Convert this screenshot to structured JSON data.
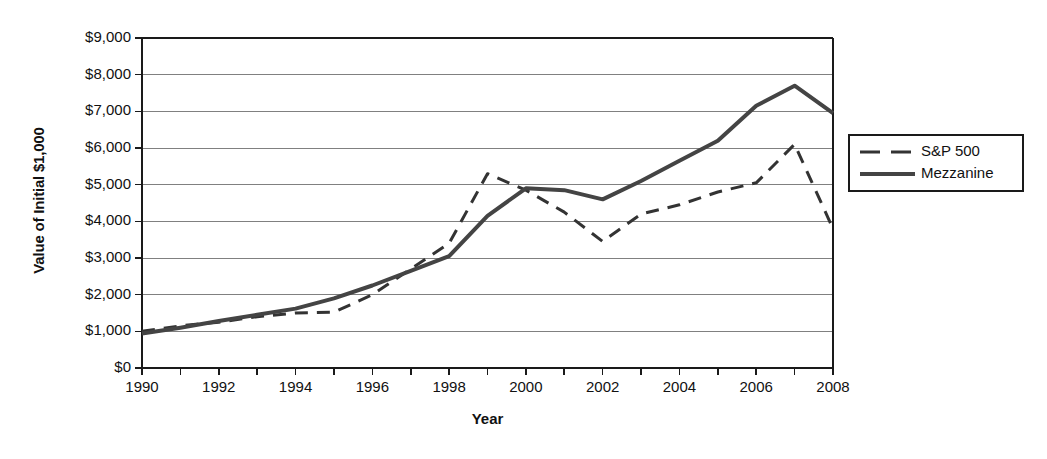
{
  "chart_data": {
    "type": "line",
    "title": "",
    "xlabel": "Year",
    "ylabel": "Value of Initial $1,000",
    "grid": true,
    "legend_position": "right-outside",
    "xlim": [
      1990,
      2008
    ],
    "ylim": [
      0,
      9000
    ],
    "x": [
      1990,
      1991,
      1992,
      1993,
      1994,
      1995,
      1996,
      1997,
      1998,
      1999,
      2000,
      2001,
      2002,
      2003,
      2004,
      2005,
      2006,
      2007,
      2008
    ],
    "xticks": [
      1990,
      1991,
      1992,
      1993,
      1994,
      1995,
      1996,
      1997,
      1998,
      1999,
      2000,
      2001,
      2002,
      2003,
      2004,
      2005,
      2006,
      2007,
      2008
    ],
    "xtick_labels_shown": [
      "1990",
      "1992",
      "1994",
      "1996",
      "1998",
      "2000",
      "2002",
      "2004",
      "2006",
      "2008"
    ],
    "yticks": [
      0,
      1000,
      2000,
      3000,
      4000,
      5000,
      6000,
      7000,
      8000,
      9000
    ],
    "ytick_labels": [
      "$0",
      "$1,000",
      "$2,000",
      "$3,000",
      "$4,000",
      "$5,000",
      "$6,000",
      "$7,000",
      "$8,000",
      "$9,000"
    ],
    "series": [
      {
        "name": "S&P 500",
        "style": "dashed",
        "color": "#333333",
        "width": 3,
        "values": [
          1000,
          1150,
          1250,
          1400,
          1500,
          1520,
          2000,
          2700,
          3400,
          5300,
          4850,
          4250,
          3450,
          4200,
          4450,
          4800,
          5050,
          6100,
          3800
        ]
      },
      {
        "name": "Mezzanine",
        "style": "solid",
        "color": "#444444",
        "width": 4,
        "values": [
          940,
          1100,
          1280,
          1450,
          1620,
          1900,
          2250,
          2650,
          3050,
          4150,
          4900,
          4850,
          4600,
          5100,
          5650,
          6200,
          7150,
          7700,
          6950
        ]
      }
    ]
  },
  "legend": {
    "items": [
      {
        "label": "S&P 500",
        "style": "dashed"
      },
      {
        "label": "Mezzanine",
        "style": "solid"
      }
    ]
  },
  "colors": {
    "axis": "#1a1a1a",
    "grid": "#808080",
    "background": "#ffffff"
  }
}
